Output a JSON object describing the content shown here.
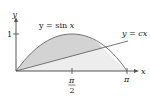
{
  "figure": {
    "axes": {
      "x_label": "x",
      "y_label": "y",
      "y_tick_label": "1",
      "x_tick_labels": {
        "half_pi_num": "π",
        "half_pi_den": "2",
        "pi": "π"
      }
    },
    "curves": [
      {
        "name": "sine",
        "label_prefix": "y = sin ",
        "label_var": "x"
      },
      {
        "name": "line",
        "label_prefix": "y = ",
        "label_var": "cx"
      }
    ],
    "colors": {
      "axis": "#555555",
      "curve": "#666666",
      "region_between": "#d3d3d3",
      "region_under_line": "#ededed",
      "text": "#222222"
    }
  }
}
